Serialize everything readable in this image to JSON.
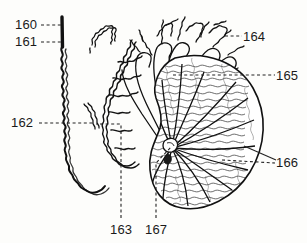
{
  "figure": {
    "type": "patent-anatomical-line-drawing",
    "background_color": "#fdfdfb",
    "ink_color": "#111111",
    "label_color": "#1a1a1a"
  },
  "reference_labels": [
    {
      "id": "160",
      "text": "160",
      "leader": "dashed-horizontal-right",
      "target": "straight-thick-duct-top"
    },
    {
      "id": "161",
      "text": "161",
      "leader": "dashed-horizontal-right",
      "target": "coiled-tubule-upper"
    },
    {
      "id": "162",
      "text": "162",
      "leader": "dashed-horizontal-right",
      "target": "convoluted-tubule-mid"
    },
    {
      "id": "163",
      "text": "163",
      "leader": "dashed-vertical-up-then-left",
      "target": "tubule-loop-right"
    },
    {
      "id": "164",
      "text": "164",
      "leader": "dashed-horizontal-left",
      "target": "branching-tubule-crown"
    },
    {
      "id": "165",
      "text": "165",
      "leader": "dashed-horizontal-left-long",
      "target": "kidney-cortex-upper"
    },
    {
      "id": "166",
      "text": "166",
      "leader": "solid-and-dashed-diagonal-left",
      "target": "kidney-medulla-lower"
    },
    {
      "id": "167",
      "text": "167",
      "leader": "dashed-vertical-up-then-diagonal",
      "target": "kidney-hilum"
    }
  ],
  "structures": [
    {
      "name": "straight-collecting-duct",
      "description": "thick vertical straight line at upper left"
    },
    {
      "name": "coiled-tubule-left",
      "description": "long wavy convoluted tube descending and hooking right at bottom"
    },
    {
      "name": "squiggle-fragment-top",
      "description": "small detached squiggly tubule segment near top center-left"
    },
    {
      "name": "squiggle-fragment-mid",
      "description": "detached convoluted tubule segment at mid-left"
    },
    {
      "name": "convoluted-tubule-right",
      "description": "dense convoluted tubule forming a descending arc"
    },
    {
      "name": "branching-tubule-crown",
      "description": "fan of squiggly branching tubules converging downward"
    },
    {
      "name": "kidney-body",
      "description": "bean / kidney-shaped organ with stippled texture"
    },
    {
      "name": "kidney-hilum",
      "description": "convergence point on left side of kidney where radiating lines meet"
    },
    {
      "name": "radiating-rays",
      "description": "medullary rays radiating from hilum to cortex"
    }
  ]
}
